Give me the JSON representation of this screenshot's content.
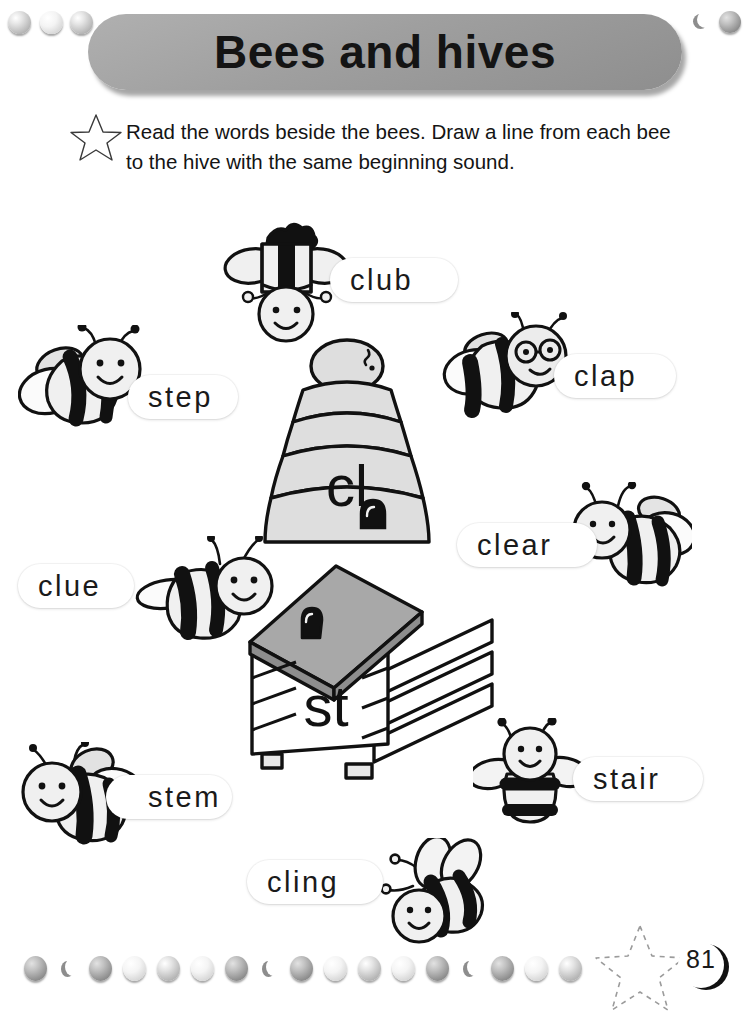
{
  "page": {
    "title": "Bees and hives",
    "page_number": "81",
    "instruction": "Read the words beside the bees. Draw a line from each bee to the hive with the same beginning sound."
  },
  "icons": {
    "star_bullet": "star-outline-icon",
    "star_footer": "dashed-star-icon",
    "page_badge": "crescent-badge-icon"
  },
  "hives": [
    {
      "id": "hive-cl",
      "label": "cl",
      "type": "skep-hive"
    },
    {
      "id": "hive-st",
      "label": "st",
      "type": "box-hive"
    }
  ],
  "words": [
    {
      "id": "word-club",
      "text": "club",
      "sound": "cl"
    },
    {
      "id": "word-step",
      "text": "step",
      "sound": "st"
    },
    {
      "id": "word-clap",
      "text": "clap",
      "sound": "cl"
    },
    {
      "id": "word-clear",
      "text": "clear",
      "sound": "cl"
    },
    {
      "id": "word-clue",
      "text": "clue",
      "sound": "cl"
    },
    {
      "id": "word-stem",
      "text": "stem",
      "sound": "st"
    },
    {
      "id": "word-stair",
      "text": "stair",
      "sound": "st"
    },
    {
      "id": "word-cling",
      "text": "cling",
      "sound": "cl"
    }
  ],
  "colors": {
    "banner_fill": "#9f9f9f",
    "ink": "#141414",
    "dot_gray": "#b9b9b9",
    "roof_gray": "#a8a8a8",
    "hive_gray": "#d9d9d9"
  }
}
